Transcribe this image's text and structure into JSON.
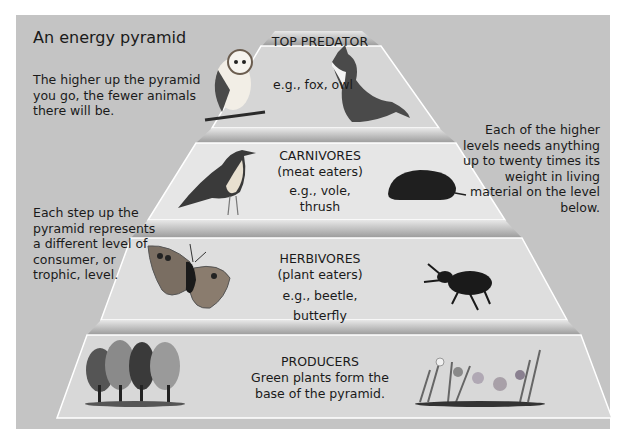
{
  "title": "An energy pyramid",
  "notes": {
    "top_left": "The higher up the pyramid you go, the fewer animals there will be.",
    "left": "Each step up the pyramid represents a different level of consumer, or trophic, level.",
    "right": "Each of the higher levels needs anything up to twenty times its weight in living material on the level below."
  },
  "levels": [
    {
      "name": "TOP PREDATOR",
      "subtitle": "",
      "examples": "e.g., fox, owl",
      "icons": [
        "owl-icon",
        "fox-icon"
      ]
    },
    {
      "name": "CARNIVORES",
      "subtitle": "(meat eaters)",
      "examples": "e.g., vole, thrush",
      "icons": [
        "thrush-icon",
        "vole-icon"
      ]
    },
    {
      "name": "HERBIVORES",
      "subtitle": "(plant eaters)",
      "examples": "e.g., beetle, butterfly",
      "icons": [
        "butterfly-icon",
        "beetle-icon"
      ]
    },
    {
      "name": "PRODUCERS",
      "subtitle": "Green plants form the base of the pyramid.",
      "examples": "",
      "icons": [
        "trees-icon",
        "flowers-icon"
      ]
    }
  ],
  "colors": {
    "background": "#c4c4c4",
    "tier": "#dcdcdc",
    "tier_edge": "#ffffff",
    "step": "#a8a8a8"
  }
}
